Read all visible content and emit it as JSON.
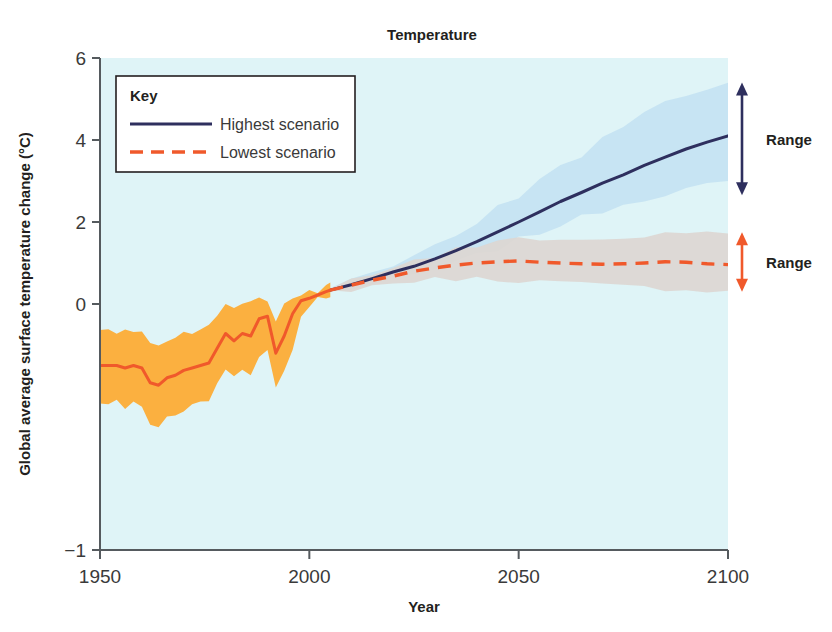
{
  "chart_data": {
    "type": "line",
    "title": "Temperature",
    "xlabel": "Year",
    "ylabel": "Global average surface temperature change (°C)",
    "xlim": [
      1950,
      2100
    ],
    "ylim": [
      -1,
      6
    ],
    "xticks": [
      "1950",
      "2000",
      "2050",
      "2100"
    ],
    "xtick_values": [
      1950,
      2000,
      2050,
      2100
    ],
    "yticks": [
      "6",
      "4",
      "2",
      "0",
      "−1"
    ],
    "ytick_values": [
      6,
      4,
      2,
      0,
      -1
    ],
    "grid": false,
    "legend": {
      "title": "Key",
      "position": "top-left-inside",
      "entries": [
        {
          "label": "Highest scenario",
          "color": "#2e2f5e",
          "style": "solid"
        },
        {
          "label": "Lowest scenario",
          "color": "#f0592b",
          "style": "dashed"
        }
      ]
    },
    "annotations": [
      {
        "label": "Range",
        "color": "#2e2f5e",
        "series": "Highest scenario",
        "at_year": 2100,
        "from": 2.65,
        "to": 5.4
      },
      {
        "label": "Range",
        "color": "#f0592b",
        "series": "Lowest scenario",
        "at_year": 2100,
        "from": 0.3,
        "to": 1.75
      }
    ],
    "series": [
      {
        "name": "Observed",
        "color": "#f0592b",
        "style": "solid",
        "band_color": "#fbb040",
        "x": [
          1950,
          1952,
          1954,
          1956,
          1958,
          1960,
          1962,
          1964,
          1966,
          1968,
          1970,
          1972,
          1974,
          1976,
          1978,
          1980,
          1982,
          1984,
          1986,
          1988,
          1990,
          1992,
          1994,
          1996,
          1998,
          2000,
          2002,
          2004,
          2005
        ],
        "values": [
          -0.25,
          -0.25,
          -0.25,
          -0.26,
          -0.25,
          -0.26,
          -0.32,
          -0.33,
          -0.3,
          -0.29,
          -0.27,
          -0.26,
          -0.25,
          -0.24,
          -0.18,
          -0.12,
          -0.15,
          -0.12,
          -0.13,
          -0.06,
          -0.05,
          -0.2,
          -0.13,
          -0.04,
          0.08,
          0.14,
          0.22,
          0.3,
          0.34
        ],
        "band_low": [
          -0.4,
          -0.4,
          -0.4,
          -0.42,
          -0.41,
          -0.42,
          -0.48,
          -0.5,
          -0.46,
          -0.45,
          -0.43,
          -0.42,
          -0.4,
          -0.39,
          -0.33,
          -0.27,
          -0.29,
          -0.27,
          -0.28,
          -0.2,
          -0.19,
          -0.34,
          -0.27,
          -0.18,
          -0.05,
          0.02,
          0.11,
          0.2,
          0.25
        ],
        "band_high": [
          -0.11,
          -0.11,
          -0.11,
          -0.11,
          -0.1,
          -0.11,
          -0.17,
          -0.17,
          -0.15,
          -0.14,
          -0.12,
          -0.11,
          -0.1,
          -0.09,
          -0.04,
          0.02,
          -0.02,
          0.02,
          0.01,
          0.07,
          0.08,
          -0.07,
          0.0,
          0.09,
          0.2,
          0.25,
          0.32,
          0.4,
          0.44
        ]
      },
      {
        "name": "Highest scenario",
        "color": "#2e2f5e",
        "style": "solid",
        "band_color": "#c5e3f2",
        "x": [
          2005,
          2010,
          2015,
          2020,
          2025,
          2030,
          2035,
          2040,
          2045,
          2050,
          2055,
          2060,
          2065,
          2070,
          2075,
          2080,
          2085,
          2090,
          2095,
          2100
        ],
        "values": [
          0.34,
          0.47,
          0.62,
          0.78,
          0.92,
          1.1,
          1.3,
          1.52,
          1.76,
          2.0,
          2.25,
          2.5,
          2.72,
          2.95,
          3.15,
          3.38,
          3.58,
          3.78,
          3.95,
          4.1
        ],
        "band_low": [
          0.3,
          0.38,
          0.48,
          0.58,
          0.7,
          0.84,
          1.0,
          1.18,
          1.36,
          1.56,
          1.74,
          1.94,
          2.1,
          2.28,
          2.44,
          2.58,
          2.7,
          2.8,
          2.88,
          2.95
        ],
        "band_high": [
          0.4,
          0.58,
          0.78,
          1.0,
          1.22,
          1.46,
          1.72,
          2.02,
          2.34,
          2.66,
          3.0,
          3.34,
          3.66,
          4.0,
          4.3,
          4.6,
          4.88,
          5.1,
          5.3,
          5.45
        ]
      },
      {
        "name": "Lowest scenario",
        "color": "#f0592b",
        "style": "dashed",
        "band_color": "#ddd6d2",
        "x": [
          2005,
          2010,
          2015,
          2020,
          2025,
          2030,
          2035,
          2040,
          2045,
          2050,
          2055,
          2060,
          2065,
          2070,
          2075,
          2080,
          2085,
          2090,
          2095,
          2100
        ],
        "values": [
          0.34,
          0.46,
          0.58,
          0.68,
          0.8,
          0.88,
          0.95,
          1.0,
          1.03,
          1.05,
          1.02,
          1.0,
          0.98,
          0.97,
          0.98,
          1.0,
          1.03,
          1.02,
          0.98,
          0.96
        ],
        "band_low": [
          0.3,
          0.36,
          0.44,
          0.5,
          0.56,
          0.6,
          0.62,
          0.62,
          0.6,
          0.58,
          0.55,
          0.52,
          0.48,
          0.45,
          0.42,
          0.4,
          0.38,
          0.36,
          0.33,
          0.3
        ],
        "band_high": [
          0.4,
          0.56,
          0.72,
          0.88,
          1.04,
          1.18,
          1.32,
          1.42,
          1.5,
          1.56,
          1.58,
          1.6,
          1.62,
          1.62,
          1.64,
          1.66,
          1.68,
          1.7,
          1.72,
          1.74
        ]
      }
    ]
  },
  "colors": {
    "plot_background": "#dff4f7",
    "page_background": "#ffffff",
    "axis": "#555a5e",
    "highest": "#2e2f5e",
    "lowest": "#f0592b",
    "observed_band": "#fbb040",
    "highest_band": "#c5e3f2",
    "lowest_band": "#ddd6d2"
  }
}
